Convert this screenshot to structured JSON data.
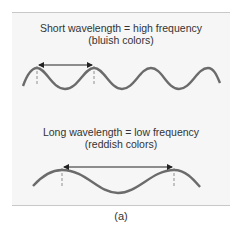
{
  "figure": {
    "top": {
      "title": "Short wavelength = high frequency",
      "subtitle": "(bluish colors)"
    },
    "bottom": {
      "title": "Long wavelength = low frequency",
      "subtitle": "(reddish colors)"
    },
    "caption": "(a)",
    "colors": {
      "wave": "#6b6b6b",
      "arrow": "#222222",
      "panel": "#f6f6f6"
    }
  }
}
